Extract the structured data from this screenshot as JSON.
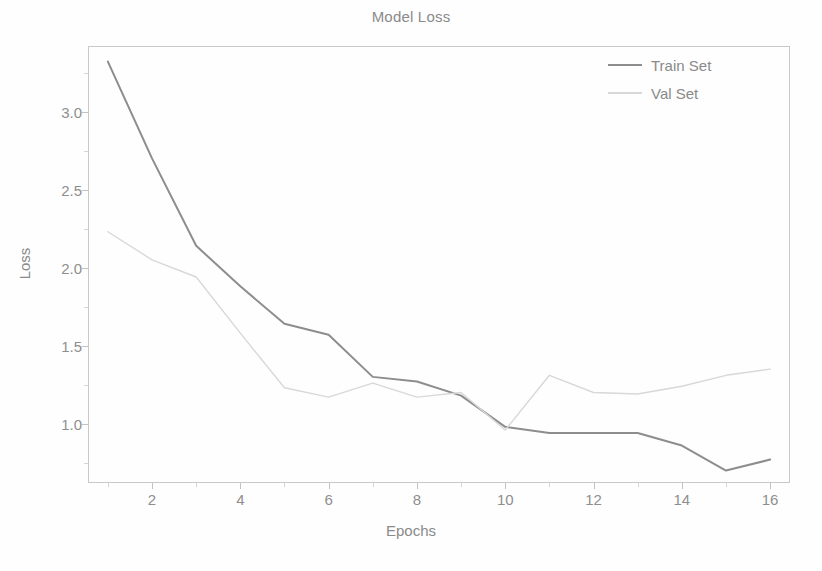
{
  "chart_data": {
    "type": "line",
    "title": "Model Loss",
    "xlabel": "Epochs",
    "ylabel": "Loss",
    "x": [
      1,
      2,
      3,
      4,
      5,
      6,
      7,
      8,
      9,
      10,
      11,
      12,
      13,
      14,
      15,
      16
    ],
    "xlim": [
      0.55,
      16.45
    ],
    "ylim": [
      0.62,
      3.42
    ],
    "xticks": [
      "2",
      "4",
      "6",
      "8",
      "10",
      "12",
      "14",
      "16"
    ],
    "xtick_values": [
      2,
      4,
      6,
      8,
      10,
      12,
      14,
      16
    ],
    "yticks": [
      "1.0",
      "1.5",
      "2.0",
      "2.5",
      "3.0"
    ],
    "ytick_values": [
      1.0,
      1.5,
      2.0,
      2.5,
      3.0
    ],
    "grid": false,
    "legend_position": "upper right",
    "series": [
      {
        "name": "Train Set",
        "color": "#8d8d8d",
        "linewidth": 2.0,
        "values": [
          3.32,
          2.7,
          2.14,
          1.88,
          1.64,
          1.57,
          1.3,
          1.27,
          1.18,
          0.98,
          0.94,
          0.94,
          0.94,
          0.86,
          0.7,
          0.77
        ]
      },
      {
        "name": "Val Set",
        "color": "#d8d8d8",
        "linewidth": 1.4,
        "values": [
          2.23,
          2.05,
          1.94,
          1.58,
          1.23,
          1.17,
          1.26,
          1.17,
          1.2,
          0.96,
          1.31,
          1.2,
          1.19,
          1.24,
          1.31,
          1.35
        ]
      }
    ]
  },
  "figure": {
    "background": "#fefefe",
    "frame_color": "#c9c9c9",
    "text_color": "#8a8a8a"
  },
  "legend": {
    "entries": [
      {
        "label": "Train Set",
        "color": "#8d8d8d"
      },
      {
        "label": "Val Set",
        "color": "#d8d8d8"
      }
    ]
  }
}
